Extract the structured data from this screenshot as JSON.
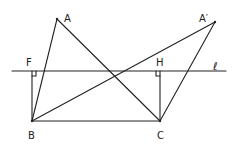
{
  "diagram": {
    "points": {
      "A": {
        "label": "A",
        "x": 57,
        "y": 19
      },
      "A_prime": {
        "label": "A′",
        "x": 215,
        "y": 22
      },
      "B": {
        "label": "B",
        "x": 32,
        "y": 121
      },
      "C": {
        "label": "C",
        "x": 160,
        "y": 121
      },
      "F": {
        "label": "F",
        "x": 32,
        "y": 71
      },
      "H": {
        "label": "H",
        "x": 160,
        "y": 71
      }
    },
    "line_label": "ℓ",
    "segments": [
      "AB",
      "AC",
      "A′B",
      "A′C",
      "BC",
      "BF",
      "CH"
    ],
    "right_angles": [
      "F",
      "H"
    ]
  }
}
